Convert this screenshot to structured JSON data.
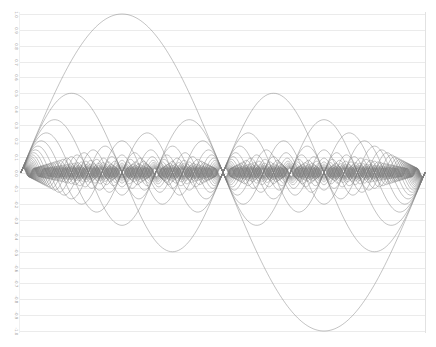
{
  "chart_data": {
    "type": "line",
    "title": "",
    "xlabel": "",
    "ylabel": "",
    "xlim": [
      0,
      6.283185307
    ],
    "ylim": [
      -1.0,
      1.0
    ],
    "grid": true,
    "legend": "none",
    "y_ticks": [
      "1.0",
      "0.9",
      "0.8",
      "0.7",
      "0.6",
      "0.5",
      "0.4",
      "0.3",
      "0.2",
      "0.1",
      "0.0",
      "-0.1",
      "-0.2",
      "-0.3",
      "-0.4",
      "-0.5",
      "-0.6",
      "-0.7",
      "-0.8",
      "-0.9",
      "-1.0"
    ],
    "x_ticks": [],
    "series_formula": "y = sin(n*x)/n",
    "series": [
      {
        "name": "n=1",
        "frequency": 1,
        "amplitude": 1.0
      },
      {
        "name": "n=2",
        "frequency": 2,
        "amplitude": 0.5
      },
      {
        "name": "n=3",
        "frequency": 3,
        "amplitude": 0.3333
      },
      {
        "name": "n=4",
        "frequency": 4,
        "amplitude": 0.25
      },
      {
        "name": "n=5",
        "frequency": 5,
        "amplitude": 0.2
      },
      {
        "name": "n=6",
        "frequency": 6,
        "amplitude": 0.1667
      },
      {
        "name": "n=7",
        "frequency": 7,
        "amplitude": 0.1429
      },
      {
        "name": "n=8",
        "frequency": 8,
        "amplitude": 0.125
      },
      {
        "name": "n=9",
        "frequency": 9,
        "amplitude": 0.1111
      },
      {
        "name": "n=10",
        "frequency": 10,
        "amplitude": 0.1
      },
      {
        "name": "n=11",
        "frequency": 11,
        "amplitude": 0.0909
      },
      {
        "name": "n=12",
        "frequency": 12,
        "amplitude": 0.0833
      },
      {
        "name": "n=13",
        "frequency": 13,
        "amplitude": 0.0769
      },
      {
        "name": "n=14",
        "frequency": 14,
        "amplitude": 0.0714
      },
      {
        "name": "n=15",
        "frequency": 15,
        "amplitude": 0.0667
      },
      {
        "name": "n=16",
        "frequency": 16,
        "amplitude": 0.0625
      },
      {
        "name": "n=17",
        "frequency": 17,
        "amplitude": 0.0588
      },
      {
        "name": "n=18",
        "frequency": 18,
        "amplitude": 0.0556
      },
      {
        "name": "n=19",
        "frequency": 19,
        "amplitude": 0.0526
      },
      {
        "name": "n=20",
        "frequency": 20,
        "amplitude": 0.05
      },
      {
        "name": "n=21",
        "frequency": 21,
        "amplitude": 0.0476
      },
      {
        "name": "n=22",
        "frequency": 22,
        "amplitude": 0.0455
      },
      {
        "name": "n=23",
        "frequency": 23,
        "amplitude": 0.0435
      },
      {
        "name": "n=24",
        "frequency": 24,
        "amplitude": 0.0417
      },
      {
        "name": "n=25",
        "frequency": 25,
        "amplitude": 0.04
      },
      {
        "name": "n=26",
        "frequency": 26,
        "amplitude": 0.0385
      },
      {
        "name": "n=27",
        "frequency": 27,
        "amplitude": 0.037
      },
      {
        "name": "n=28",
        "frequency": 28,
        "amplitude": 0.0357
      },
      {
        "name": "n=29",
        "frequency": 29,
        "amplitude": 0.0345
      },
      {
        "name": "n=30",
        "frequency": 30,
        "amplitude": 0.0333
      },
      {
        "name": "n=31",
        "frequency": 31,
        "amplitude": 0.0323
      },
      {
        "name": "n=32",
        "frequency": 32,
        "amplitude": 0.0313
      },
      {
        "name": "n=33",
        "frequency": 33,
        "amplitude": 0.0303
      },
      {
        "name": "n=34",
        "frequency": 34,
        "amplitude": 0.0294
      },
      {
        "name": "n=35",
        "frequency": 35,
        "amplitude": 0.0286
      },
      {
        "name": "n=36",
        "frequency": 36,
        "amplitude": 0.0278
      },
      {
        "name": "n=37",
        "frequency": 37,
        "amplitude": 0.027
      },
      {
        "name": "n=38",
        "frequency": 38,
        "amplitude": 0.0263
      },
      {
        "name": "n=39",
        "frequency": 39,
        "amplitude": 0.0256
      },
      {
        "name": "n=40",
        "frequency": 40,
        "amplitude": 0.025
      }
    ],
    "key_points": {
      "n1_peak": {
        "x": 1.5708,
        "y": 1.0
      },
      "n1_trough": {
        "x": 4.7124,
        "y": -1.0
      },
      "n2_peak": {
        "x": 0.7854,
        "y": 0.5
      },
      "n3_peak": {
        "x": 0.5236,
        "y": 0.3333
      },
      "n4_peak": {
        "x": 0.3927,
        "y": 0.25
      },
      "common_zero_crossings": [
        0,
        3.1416,
        6.2832
      ]
    }
  },
  "colors": {
    "curve": "#7d7d7d",
    "grid": "#ebebeb",
    "tick_label": "#9a9a9a",
    "background": "#ffffff"
  },
  "plot_area": {
    "left": 21,
    "right": 425,
    "top": 14,
    "bottom": 331
  }
}
